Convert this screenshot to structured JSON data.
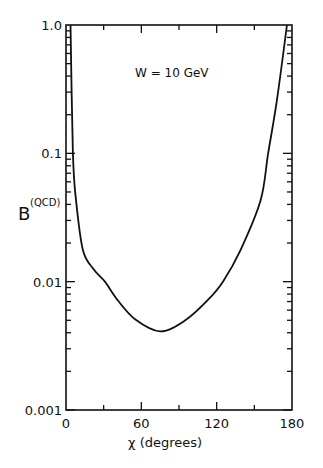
{
  "chart_data": {
    "type": "line",
    "title": "",
    "annotation": "W = 10 GeV",
    "xlabel": "χ  (degrees)",
    "ylabel": "B",
    "ylabel_superscript": "(QCD)",
    "xlim": [
      0,
      180
    ],
    "ylim": [
      0.001,
      1.0
    ],
    "yscale": "log",
    "xticks": [
      0,
      60,
      120,
      180
    ],
    "xtick_labels": [
      "0",
      "60",
      "120",
      "180"
    ],
    "x_minor_ticks": [
      30,
      90,
      150
    ],
    "yticks": [
      0.001,
      0.01,
      0.1,
      1.0
    ],
    "ytick_labels": [
      "0.001",
      "0.01",
      "0.1",
      "1.0"
    ],
    "grid": false,
    "legend": null,
    "series": [
      {
        "name": "W = 10 GeV",
        "x": [
          3.6,
          5.5,
          8,
          13.5,
          22,
          31,
          41,
          55,
          75,
          95,
          113,
          125,
          139,
          155,
          161,
          168,
          176
        ],
        "y": [
          1.0,
          0.1,
          0.043,
          0.0176,
          0.0125,
          0.01,
          0.0072,
          0.0051,
          0.0041,
          0.005,
          0.0072,
          0.01,
          0.0176,
          0.043,
          0.1,
          0.26,
          1.0
        ]
      }
    ]
  }
}
